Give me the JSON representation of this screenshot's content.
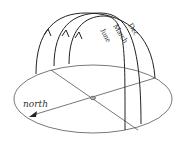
{
  "diagram": {
    "labels": {
      "north": "north",
      "seasons": [
        "Dec",
        "March",
        "June"
      ]
    },
    "colors": {
      "line": "#222222",
      "thin_line": "#555555",
      "background": "#ffffff"
    },
    "elements": [
      {
        "name": "horizon-ellipse",
        "type": "ellipse"
      },
      {
        "name": "north-arrow",
        "type": "arrow",
        "label": "north"
      },
      {
        "name": "east-west-line",
        "type": "line"
      },
      {
        "name": "observer-point",
        "type": "point"
      },
      {
        "name": "sun-path-dec",
        "type": "arc",
        "label": "Dec"
      },
      {
        "name": "sun-path-march",
        "type": "arc",
        "label": "March"
      },
      {
        "name": "sun-path-june",
        "type": "arc",
        "label": "June"
      }
    ]
  }
}
